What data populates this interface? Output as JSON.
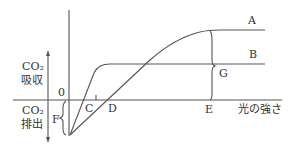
{
  "diagram": {
    "title": "",
    "y_axis": {
      "upper_label_line1": "CO₂",
      "upper_label_line2": "吸収",
      "lower_label_line1": "CO₂",
      "lower_label_line2": "排出",
      "origin_label": "0"
    },
    "x_axis": {
      "label": "光の強さ"
    },
    "curves": [
      {
        "id": "A",
        "label": "A",
        "description": "curve with higher saturation level"
      },
      {
        "id": "B",
        "label": "B",
        "description": "curve with lower saturation level"
      }
    ],
    "points": {
      "C": "C",
      "D": "D",
      "E": "E",
      "F": "F",
      "G": "G"
    },
    "colors": {
      "line": "#555555",
      "text": "#333333",
      "background": "#ffffff"
    }
  }
}
